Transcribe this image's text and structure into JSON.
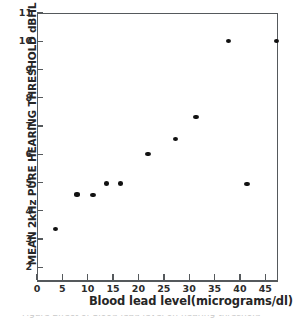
{
  "chart_data": {
    "type": "scatter",
    "title": "",
    "xlabel": "Blood lead level(micrograms/dl)",
    "ylabel": "MEAN 2kHz PURE HEARING THRESHOLD dBHL",
    "xlim": [
      0,
      47.5
    ],
    "ylim": [
      1.55,
      11
    ],
    "xticks": [
      0,
      5,
      10,
      15,
      20,
      25,
      30,
      35,
      40,
      45
    ],
    "yticks": [
      2,
      3,
      4,
      5,
      6,
      7,
      8,
      9,
      10,
      11
    ],
    "grid": false,
    "legend": null,
    "marker_color": "#111111",
    "axis_color": "#55595c",
    "points": [
      {
        "x": 3.7,
        "y": 3.35
      },
      {
        "x": 7.9,
        "y": 4.58
      },
      {
        "x": 11.0,
        "y": 4.55
      },
      {
        "x": 13.7,
        "y": 4.97
      },
      {
        "x": 16.4,
        "y": 4.97
      },
      {
        "x": 21.9,
        "y": 6.0
      },
      {
        "x": 27.3,
        "y": 6.55
      },
      {
        "x": 31.3,
        "y": 7.33
      },
      {
        "x": 37.8,
        "y": 10.0
      },
      {
        "x": 41.4,
        "y": 4.95
      },
      {
        "x": 47.2,
        "y": 10.0
      }
    ]
  },
  "caption": {
    "clipped_text": "Figure  Effect of blood lead level on hearing threshold"
  }
}
